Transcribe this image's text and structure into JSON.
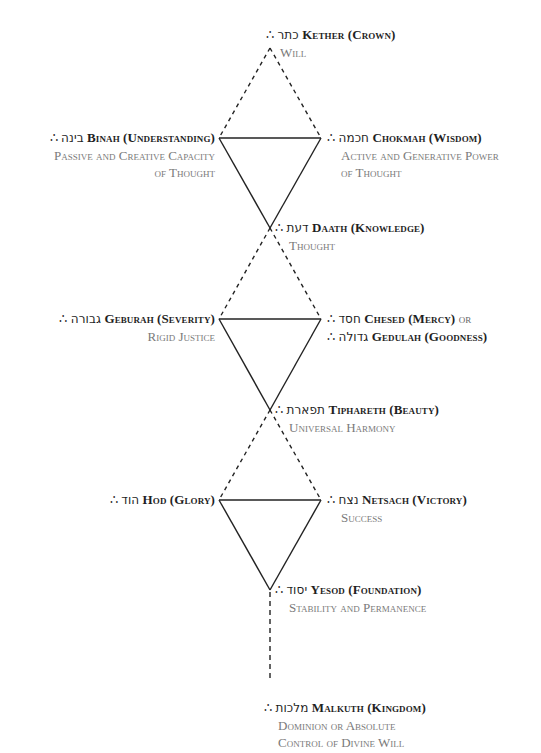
{
  "therefore_symbol": "∴",
  "colors": {
    "heading": "#1f1f1f",
    "description": "#7a7a7a",
    "line": "#222222"
  },
  "sephiroth": {
    "kether": {
      "hebrew": "כתר",
      "name": "Kether (Crown)",
      "desc": [
        "Will"
      ]
    },
    "binah": {
      "hebrew": "בינה",
      "name": "Binah (Understanding)",
      "desc": [
        "Passive and Creative Capacity",
        "of Thought"
      ]
    },
    "chokmah": {
      "hebrew": "חכמה",
      "name": "Chokmah (Wisdom)",
      "desc": [
        "Active and Generative Power",
        "of Thought"
      ]
    },
    "daath": {
      "hebrew": "דעת",
      "name": "Daath (Knowledge)",
      "desc": [
        "Thought"
      ]
    },
    "geburah": {
      "hebrew": "גבורה",
      "name": "Geburah (Severity)",
      "desc": [
        "Rigid Justice"
      ]
    },
    "chesed": {
      "hebrew": "חסד",
      "name": "Chesed (Mercy)",
      "or": "or"
    },
    "gedulah": {
      "hebrew": "גדולה",
      "name": "Gedulah (Goodness)"
    },
    "tiphareth": {
      "hebrew": "תפארת",
      "name": "Tiphareth (Beauty)",
      "desc": [
        "Universal Harmony"
      ]
    },
    "hod": {
      "hebrew": "הוד",
      "name": "Hod (Glory)"
    },
    "netsach": {
      "hebrew": "נצח",
      "name": "Netsach (Victory)",
      "desc": [
        "Success"
      ]
    },
    "yesod": {
      "hebrew": "יסוד",
      "name": "Yesod (Foundation)",
      "desc": [
        "Stability and Permanence"
      ]
    },
    "malkuth": {
      "hebrew": "מלכות",
      "name": "Malkuth (Kingdom)",
      "desc": [
        "Dominion or Absolute",
        "Control of Divine Will"
      ]
    }
  }
}
